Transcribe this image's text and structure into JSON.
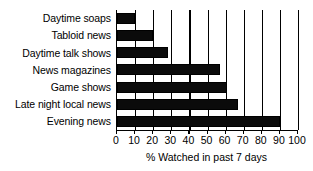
{
  "chart_data": {
    "type": "bar",
    "orientation": "horizontal",
    "title": "",
    "xlabel": "% Watched in past 7 days",
    "ylabel": "",
    "categories": [
      "Daytime soaps",
      "Tabloid news",
      "Daytime talk shows",
      "News magazines",
      "Game shows",
      "Late night local news",
      "Evening news"
    ],
    "values": [
      10,
      20,
      28,
      57,
      61,
      67,
      90
    ],
    "xlim": [
      0,
      100
    ],
    "xticks": [
      0,
      10,
      20,
      30,
      40,
      50,
      60,
      70,
      80,
      90,
      100
    ],
    "xtick_labels": [
      "0",
      "10",
      "20",
      "30",
      "40",
      "50",
      "60",
      "70",
      "80",
      "90",
      "100"
    ],
    "grid": "vertical",
    "legend": "none",
    "bar_color": "#0b0b0b",
    "background_color": "#ffffff",
    "axis_color": "#000000"
  }
}
